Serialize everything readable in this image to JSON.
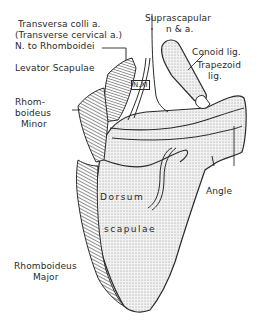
{
  "figure": {
    "labels": {
      "transversa_colli": "Transversa colli a.",
      "transverse_cervical": "(Transverse cervical a.)",
      "n_rhomboidei": "N. to Rhomboidei",
      "levator_scapulae": "Levator Scapulae",
      "rhomboideus_minor_1": "Rhom-",
      "rhomboideus_minor_2": "boideus",
      "rhomboideus_minor_3": "Minor",
      "rhomboideus_major_1": "Rhomboideus",
      "rhomboideus_major_2": "Major",
      "suprascapular_1": "Suprascapular",
      "suprascapular_2": "n & a.",
      "conoid_lig": "Conoid lig.",
      "trapezoid_1": "Trapezoid",
      "trapezoid_2": "lig.",
      "nerve_xi": "N.XI",
      "dorsum": "Dorsum",
      "scapulae": "scapulae",
      "angle": "Angle"
    },
    "colors": {
      "ink": "#2a2a2a",
      "bone_fill": "#e9e9e9",
      "background": "#ffffff"
    }
  }
}
